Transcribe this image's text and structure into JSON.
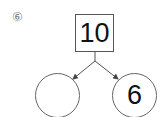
{
  "problem": {
    "number_label": "⑥",
    "total": "10",
    "parts": [
      {
        "value": ""
      },
      {
        "value": "6"
      }
    ]
  },
  "colors": {
    "line": "#555555",
    "text": "#111111",
    "label": "#777777"
  }
}
